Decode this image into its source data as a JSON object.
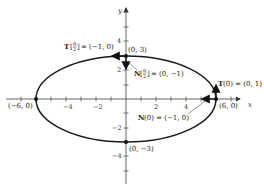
{
  "diagram": {
    "title": "",
    "ellipse": {
      "a": 6,
      "b": 3,
      "equation": "x^2/36 + y^2/9 = 1"
    },
    "axes": {
      "x_label": "x",
      "y_label": "y"
    },
    "x_ticks": [
      {
        "value": -4,
        "label": "−4"
      },
      {
        "value": -2,
        "label": "−2"
      },
      {
        "value": 2,
        "label": "2"
      },
      {
        "value": 4,
        "label": "4"
      }
    ],
    "y_ticks": [
      {
        "value": 4,
        "label": "4"
      },
      {
        "value": 2,
        "label": "2"
      },
      {
        "value": -2,
        "label": "−2"
      },
      {
        "value": -4,
        "label": "−4"
      }
    ],
    "points": {
      "top": "(0, 3)",
      "right": "(6, 0)",
      "left": "(−6, 0)",
      "bottom": "(0, −3)"
    },
    "vectors": {
      "T_pi2_prefix": "T",
      "T_pi2_arg_num": "π",
      "T_pi2_arg_den": "2",
      "T_pi2_value": "= (−1, 0)",
      "N_pi2_prefix": "N",
      "N_pi2_arg_num": "π",
      "N_pi2_arg_den": "2",
      "N_pi2_value": "= (0, −1)",
      "T0_prefix": "T",
      "T0_value": "(0) = (0, 1)",
      "N0_prefix": "N",
      "N0_value": "(0) = (−1, 0)"
    },
    "colors": {
      "curve": "#1a1a1a",
      "axis": "#555555",
      "text": "#222222"
    }
  }
}
